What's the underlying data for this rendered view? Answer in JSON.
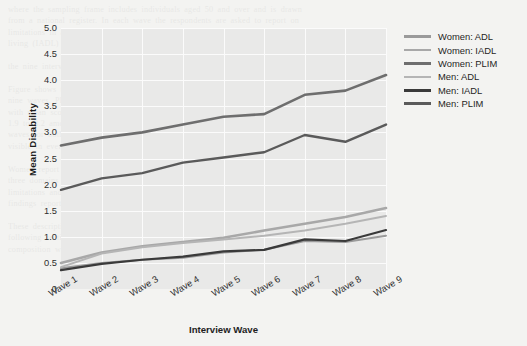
{
  "page": {
    "bleed_text": "where the sampling frame includes individuals aged 50 and over and is drawn\nfrom a national register. In each wave the respondents are asked to report on\nlimitations in activities of daily living (ADL), instrumental activities of daily\nliving (IADL) and physical limitations (PLIM). Mean scores are computed for\n\nthe nine interview waves that are available.\n\nFigure shows the mean disability trajectories for men and women across the\nnine waves. Physical limitations (PLIM) are by far the most prevalent domain,\nwith mean scores rising from about 2.8 to 4.1 among women and from about\n1.9 to 3.2 among men. The ADL and IADL means remain well below 1.6 in all\nwaves for both sexes, although the upward gradient across waves is clearly\nvisible in every series.\n\nWomen report consistently higher mean disability than men in each of the\nthree domains and at every interview wave. The gap is widest for physical\nlimitations and narrowest for ADL limitations, which is consistent with earlier\nfindings reported in the literature on the gender paradox in later life health.\n\nThese descriptive patterns motivate the multivariate models presented in the\nfollowing section, where we adjust for age, education, and household\ncomposition when estimating the rate of change in disability over time."
  },
  "chart_data": {
    "type": "line",
    "title": "",
    "xlabel": "Interview Wave",
    "ylabel": "Mean Disability",
    "categories": [
      "Wave 1",
      "Wave 2",
      "Wave 3",
      "Wave 4",
      "Wave 5",
      "Wave 6",
      "Wave 7",
      "Wave 8",
      "Wave 9"
    ],
    "ylim": [
      0,
      5.0
    ],
    "yticks": [
      "0",
      "0.5",
      "1.0",
      "1.5",
      "2.0",
      "2.5",
      "3.0",
      "3.5",
      "4.0",
      "4.5",
      "5.0"
    ],
    "ytick_values": [
      0,
      0.5,
      1.0,
      1.5,
      2.0,
      2.5,
      3.0,
      3.5,
      4.0,
      4.5,
      5.0
    ],
    "grid": true,
    "legend_position": "top-right",
    "series": [
      {
        "name": "Women: ADL",
        "color": "#9a9a9a",
        "width": 2.0,
        "values": [
          0.4,
          0.5,
          0.56,
          0.6,
          0.7,
          0.75,
          0.92,
          0.9,
          1.02
        ]
      },
      {
        "name": "Women: IADL",
        "color": "#a8a8a8",
        "width": 2.6,
        "values": [
          0.5,
          0.7,
          0.82,
          0.9,
          0.98,
          1.12,
          1.25,
          1.38,
          1.55
        ]
      },
      {
        "name": "Women: PLIM",
        "color": "#6e6e6e",
        "width": 2.6,
        "values": [
          2.75,
          2.9,
          3.0,
          3.15,
          3.3,
          3.35,
          3.72,
          3.8,
          4.1
        ]
      },
      {
        "name": "Men: ADL",
        "color": "#b5b5b5",
        "width": 2.0,
        "values": [
          0.42,
          0.68,
          0.8,
          0.88,
          0.95,
          1.02,
          1.12,
          1.25,
          1.4
        ]
      },
      {
        "name": "Men: IADL",
        "color": "#3a3a3a",
        "width": 2.2,
        "values": [
          0.36,
          0.48,
          0.56,
          0.62,
          0.72,
          0.75,
          0.95,
          0.92,
          1.13
        ]
      },
      {
        "name": "Men: PLIM",
        "color": "#5a5a5a",
        "width": 2.4,
        "values": [
          1.9,
          2.12,
          2.22,
          2.42,
          2.52,
          2.62,
          2.95,
          2.82,
          3.15
        ]
      }
    ]
  },
  "colors": {
    "page_background": "#f3f3f1",
    "plot_background": "#e9e9e8",
    "gridline": "#fbfbfb",
    "text": "#2d2d2d"
  }
}
